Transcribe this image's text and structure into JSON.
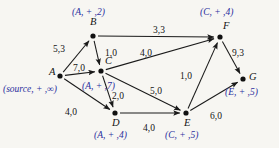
{
  "figure": {
    "kind": "network-flow-graph",
    "background_color": "#f7f6f2",
    "edge_color": "#1a1a1a",
    "node_color": "#111111",
    "annotation_color": "#2b2f9e",
    "label_color": "#141414"
  },
  "nodes": [
    {
      "id": "A",
      "name": "A",
      "x": 60,
      "y": 76,
      "name_dx": -11,
      "name_dy": -4,
      "annotation": "(source, + ,∞)",
      "annot_x": 3,
      "annot_y": 85
    },
    {
      "id": "B",
      "name": "B",
      "x": 93,
      "y": 36,
      "name_dx": -3,
      "name_dy": -14,
      "annotation": "(A, + ,2)",
      "annot_x": 72,
      "annot_y": 8
    },
    {
      "id": "C",
      "name": "C",
      "x": 101,
      "y": 71,
      "name_dx": 4,
      "name_dy": -10,
      "annotation": "(A, + ,7)",
      "annot_x": 82,
      "annot_y": 82
    },
    {
      "id": "D",
      "name": "D",
      "x": 115,
      "y": 113,
      "name_dx": -3,
      "name_dy": 10,
      "annotation": "(A, + ,4)",
      "annot_x": 94,
      "annot_y": 131
    },
    {
      "id": "E",
      "name": "E",
      "x": 186,
      "y": 113,
      "name_dx": -2,
      "name_dy": 10,
      "annotation": "(C, + ,5)",
      "annot_x": 165,
      "annot_y": 131
    },
    {
      "id": "F",
      "name": "F",
      "x": 220,
      "y": 37,
      "name_dx": 3,
      "name_dy": -11,
      "annotation": "(C, + ,4)",
      "annot_x": 200,
      "annot_y": 8
    },
    {
      "id": "G",
      "name": "G",
      "x": 243,
      "y": 79,
      "name_dx": 6,
      "name_dy": -2,
      "annotation": "(E, + ,5)",
      "annot_x": 225,
      "annot_y": 88
    }
  ],
  "edges": [
    {
      "from": "A",
      "to": "B",
      "capacity": 5,
      "flow": 3,
      "label": "5,3",
      "label_x": 53,
      "label_y": 45
    },
    {
      "from": "A",
      "to": "C",
      "capacity": 7,
      "flow": 0,
      "label": "7,0",
      "label_x": 73,
      "label_y": 64
    },
    {
      "from": "A",
      "to": "D",
      "capacity": 4,
      "flow": 0,
      "label": "4,0",
      "label_x": 65,
      "label_y": 108
    },
    {
      "from": "B",
      "to": "C",
      "capacity": 1,
      "flow": 0,
      "label": "1,0",
      "label_x": 105,
      "label_y": 49
    },
    {
      "from": "B",
      "to": "F",
      "capacity": 3,
      "flow": 3,
      "label": "3,3",
      "label_x": 153,
      "label_y": 26
    },
    {
      "from": "C",
      "to": "F",
      "capacity": 4,
      "flow": 0,
      "label": "4,0",
      "label_x": 140,
      "label_y": 49
    },
    {
      "from": "C",
      "to": "D",
      "capacity": 2,
      "flow": 0,
      "label": "2,0",
      "label_x": 112,
      "label_y": 92
    },
    {
      "from": "C",
      "to": "E",
      "capacity": 5,
      "flow": 0,
      "label": "5,0",
      "label_x": 150,
      "label_y": 87
    },
    {
      "from": "D",
      "to": "E",
      "capacity": 4,
      "flow": 0,
      "label": "4,0",
      "label_x": 143,
      "label_y": 124
    },
    {
      "from": "E",
      "to": "F",
      "capacity": 1,
      "flow": 0,
      "label": "1,0",
      "label_x": 180,
      "label_y": 72
    },
    {
      "from": "E",
      "to": "G",
      "capacity": 6,
      "flow": 0,
      "label": "6,0",
      "label_x": 210,
      "label_y": 112
    },
    {
      "from": "F",
      "to": "G",
      "capacity": 9,
      "flow": 3,
      "label": "9,3",
      "label_x": 232,
      "label_y": 49
    }
  ]
}
